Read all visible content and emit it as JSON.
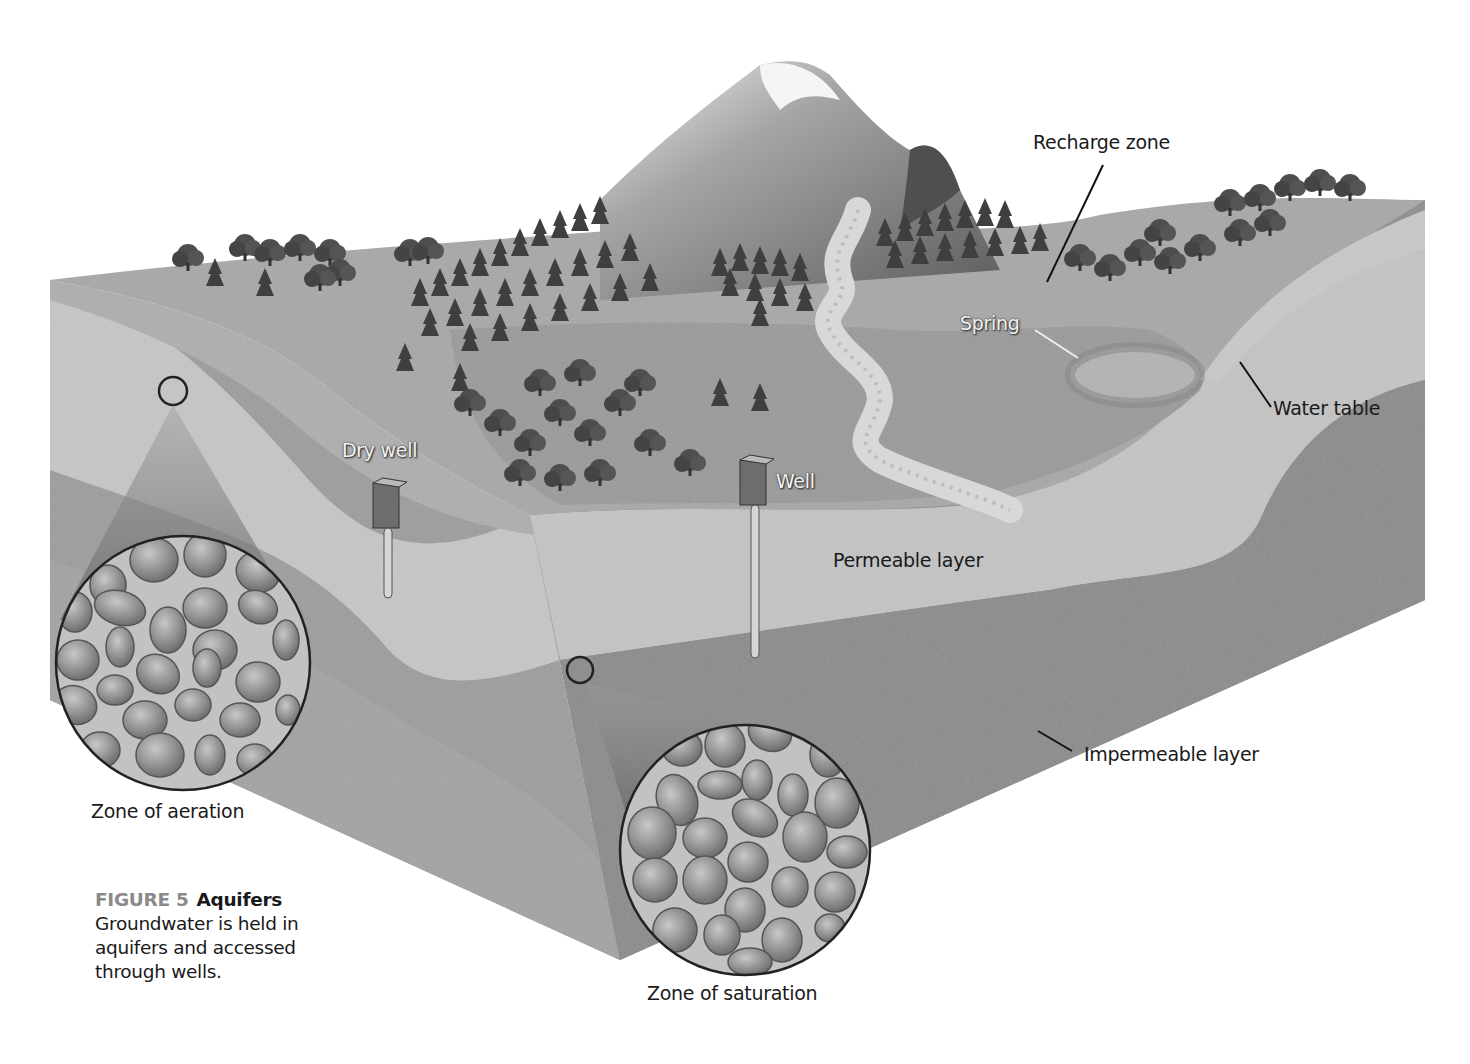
{
  "figure": {
    "number": "FIGURE 5",
    "title": "Aquifers",
    "caption": "Groundwater is held in aquifers and accessed through wells."
  },
  "labels": {
    "recharge_zone": "Recharge zone",
    "spring": "Spring",
    "water_table": "Water table",
    "dry_well": "Dry well",
    "well": "Well",
    "permeable_layer": "Permeable layer",
    "impermeable_layer": "Impermeable layer",
    "zone_of_aeration": "Zone of aeration",
    "zone_of_saturation": "Zone of saturation"
  },
  "colors": {
    "background": "#ffffff",
    "surface": "#a9a9a9",
    "topsoil_face": "#b8b8b8",
    "permeable": "#c9c9c9",
    "impermeable": "#8e8e8e",
    "deep_layer": "#9c9c9c",
    "river": "#d6d6d6",
    "trees": "#4a4a4a",
    "pebble": "#8f8f8f",
    "label_text": "#1a1a1a",
    "figure_number": "#8a8a8a"
  }
}
